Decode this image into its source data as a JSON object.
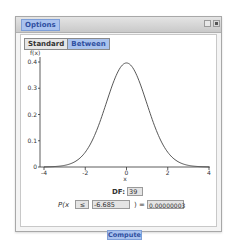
{
  "window": {
    "options_label": "Options",
    "controls": [
      "maximize",
      "close"
    ]
  },
  "tabs": [
    {
      "label": "Standard",
      "active": false
    },
    {
      "label": "Between",
      "active": true
    }
  ],
  "chart_data": {
    "type": "line",
    "title": "",
    "xlabel": "x",
    "ylabel": "f(x)",
    "xlim": [
      -4,
      4
    ],
    "ylim": [
      0,
      0.4
    ],
    "x_ticks": [
      "-4",
      "-2",
      "0",
      "2",
      "4"
    ],
    "y_ticks": [
      "0",
      "0.1",
      "0.2",
      "0.3",
      "0.4"
    ],
    "series": [
      {
        "name": "t density (df=39)",
        "x": [
          -4,
          -3.5,
          -3,
          -2.5,
          -2,
          -1.5,
          -1,
          -0.5,
          0,
          0.5,
          1,
          1.5,
          2,
          2.5,
          3,
          3.5,
          4
        ],
        "values": [
          0.0002,
          0.0011,
          0.0051,
          0.0184,
          0.0551,
          0.129,
          0.2398,
          0.3513,
          0.3964,
          0.3513,
          0.2398,
          0.129,
          0.0551,
          0.0184,
          0.0051,
          0.0011,
          0.0002
        ]
      }
    ],
    "grid": false
  },
  "calc": {
    "df_label": "DF:",
    "df_value": "39",
    "p_label": "P(",
    "x_label": "x",
    "operator": "≤",
    "x_value": "-6.685",
    "close_paren": ")",
    "equals": "=",
    "result": "0.00000003",
    "compute_label": "Compute"
  },
  "colors": {
    "accent_bg": "#a9c2ee",
    "accent_text": "#2f4fa0",
    "curve": "#444444"
  }
}
